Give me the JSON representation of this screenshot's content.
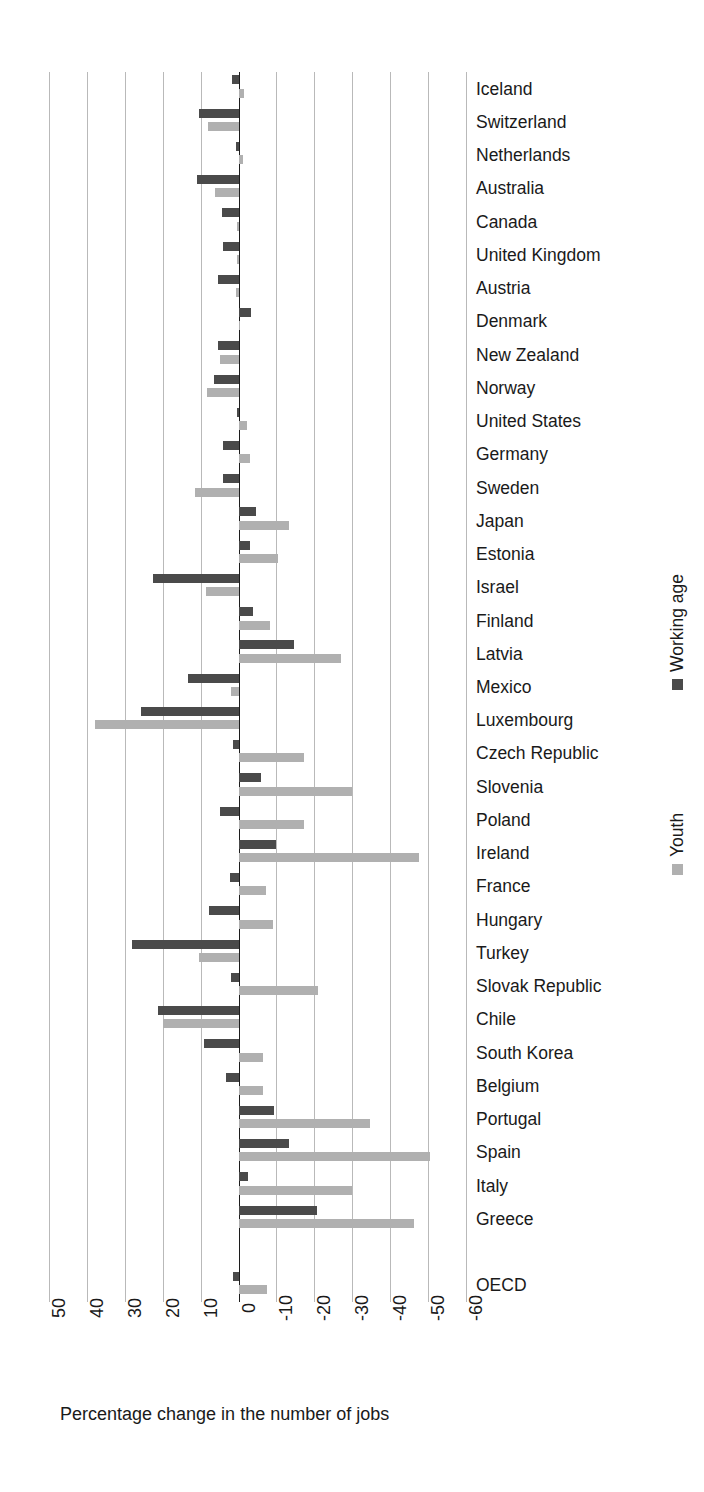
{
  "chart_data": {
    "type": "bar",
    "orientation": "horizontal",
    "title": "",
    "xlabel": "Percentage change in the number of jobs",
    "ylabel": "",
    "xlim": [
      50,
      -60
    ],
    "xticks": [
      50,
      40,
      30,
      20,
      10,
      0,
      -10,
      -20,
      -30,
      -40,
      -50,
      -60
    ],
    "xtick_labels": [
      "50",
      "40",
      "30",
      "20",
      "10",
      "0",
      "-10",
      "-20",
      "-30",
      "-40",
      "-50",
      "-60"
    ],
    "grid": true,
    "legend_position": "right-outside",
    "series": [
      {
        "name": "Working age",
        "color": "#4a4a4a",
        "values": [
          1.7,
          10.3,
          0.6,
          11.0,
          4.4,
          4.0,
          5.5,
          -3.2,
          5.5,
          6.6,
          0.4,
          4.2,
          4.2,
          -4.5,
          -3.1,
          22.5,
          -3.7,
          -14.7,
          13.4,
          25.8,
          1.5,
          -6.0,
          4.8,
          -10.0,
          2.3,
          7.8,
          28.0,
          2.0,
          21.2,
          9.1,
          3.4,
          -9.4,
          -13.2,
          -2.5,
          -20.7,
          null,
          1.5
        ]
      },
      {
        "name": "Youth",
        "color": "#b0b0b0",
        "values": [
          -1.5,
          8.0,
          -1.3,
          6.3,
          0.5,
          0.4,
          0.8,
          -0.4,
          5.0,
          8.3,
          -2.2,
          -3.1,
          11.6,
          -13.2,
          -10.5,
          8.7,
          -8.2,
          -27.0,
          1.9,
          37.9,
          -17.4,
          -29.8,
          -17.4,
          -47.5,
          -7.3,
          -9.0,
          10.5,
          -20.9,
          19.8,
          -6.4,
          -6.4,
          -34.6,
          -50.4,
          -29.8,
          -46.3,
          null,
          -7.5
        ]
      }
    ],
    "categories": [
      "Iceland",
      "Switzerland",
      "Netherlands",
      "Australia",
      "Canada",
      "United Kingdom",
      "Austria",
      "Denmark",
      "New Zealand",
      "Norway",
      "United States",
      "Germany",
      "Sweden",
      "Japan",
      "Estonia",
      "Israel",
      "Finland",
      "Latvia",
      "Mexico",
      "Luxembourg",
      "Czech Republic",
      "Slovenia",
      "Poland",
      "Ireland",
      "France",
      "Hungary",
      "Turkey",
      "Slovak Republic",
      "Chile",
      " South Korea",
      "Belgium",
      "Portugal",
      "Spain",
      "Italy",
      "Greece",
      "",
      "OECD"
    ]
  },
  "legend": {
    "entries": [
      {
        "label": "Working age",
        "color": "#4a4a4a"
      },
      {
        "label": "Youth",
        "color": "#b0b0b0"
      }
    ]
  },
  "axis": {
    "title": "Percentage change in the number of jobs"
  },
  "colors": {
    "working_age": "#4a4a4a",
    "youth": "#b0b0b0",
    "gridline": "#b9b9b9",
    "zero_line": "#1c1c1c",
    "text": "#1a1a1a",
    "background": "#ffffff"
  }
}
